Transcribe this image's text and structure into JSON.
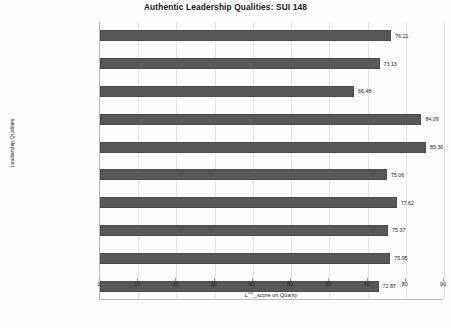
{
  "chart_data": {
    "type": "bar",
    "orientation": "horizontal",
    "title": "Authentic Leadership Qualities: SUI 148",
    "xlabel": "L100_score on Quality",
    "xlabel_base": "L",
    "xlabel_sup": "100",
    "xlabel_rest": "_score on Quality",
    "ylabel": "Leadership Qualities",
    "categories": [
      "Leadership Mean Score",
      "Accountability**",
      "Innovation and creative thinking",
      "Empathy**",
      "Good communication skills",
      "Honesty and integrity**",
      "Capacity to inspire others",
      "Decision making capability",
      "Commitment",
      "Confidence"
    ],
    "values": [
      76.21,
      73.13,
      66.48,
      84.09,
      85.3,
      75.06,
      77.62,
      75.37,
      75.95,
      72.87
    ],
    "value_labels": [
      "76.21",
      "73.13",
      "66.48",
      "84.09",
      "85.30",
      "75.06",
      "77.62",
      "75.37",
      "75.95",
      "72.87"
    ],
    "xlim": [
      0,
      90
    ],
    "xticks": [
      0,
      10,
      20,
      30,
      40,
      50,
      60,
      70,
      80,
      90
    ],
    "xtick_labels": [
      "0",
      "10",
      "20",
      "30",
      "40",
      "50",
      "60",
      "70",
      "80",
      "90"
    ],
    "grid": true,
    "legend": false,
    "bar_color": "#585858",
    "grid_color": "#e3e3e3",
    "axis_color": "#b9b9b9",
    "background": "#fdfdfd"
  }
}
